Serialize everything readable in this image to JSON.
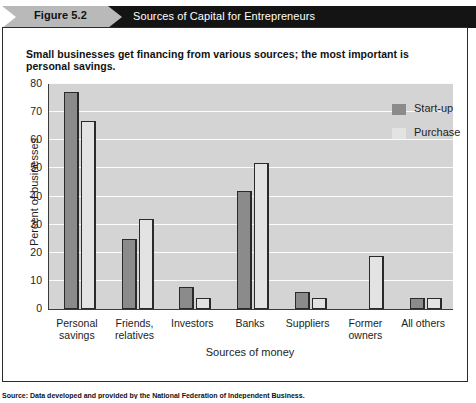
{
  "header": {
    "figure_label": "Figure 5.2",
    "title": "Sources of Capital for Entrepreneurs"
  },
  "subtitle": "Small businesses get financing from various sources; the most important is personal savings.",
  "source": "Source: Data developed and provided by the National Federation of Independent Business.",
  "legend": {
    "position": "top-right",
    "items": [
      {
        "label": "Start-up",
        "color": "#8b8b8b",
        "icon": "legend-swatch"
      },
      {
        "label": "Purchase",
        "color": "#e3e3e3",
        "icon": "legend-swatch"
      }
    ]
  },
  "chart_data": {
    "type": "bar",
    "title": "Sources of Capital for Entrepreneurs",
    "xlabel": "Sources of money",
    "ylabel": "Percent of businesses",
    "ylim": [
      0,
      80
    ],
    "yticks": [
      0,
      10,
      20,
      30,
      40,
      50,
      60,
      70,
      80
    ],
    "grid": true,
    "categories": [
      "Personal savings",
      "Friends, relatives",
      "Investors",
      "Banks",
      "Suppliers",
      "Former owners",
      "All others"
    ],
    "series": [
      {
        "name": "Start-up",
        "values": [
          77,
          25,
          8,
          42,
          6,
          0,
          4
        ]
      },
      {
        "name": "Purchase",
        "values": [
          67,
          32,
          4,
          52,
          4,
          19,
          4
        ]
      }
    ]
  }
}
